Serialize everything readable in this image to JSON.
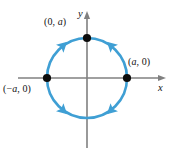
{
  "figure": {
    "type": "math-diagram",
    "background_color": "#ffffff",
    "curve": {
      "name": "circle",
      "color": "#3f9fd4",
      "stroke_width": 2.6,
      "center": [
        87,
        78
      ],
      "radius": 40,
      "orientation_arrow_count": 4
    },
    "axes": {
      "color": "#808080",
      "x_label": "x",
      "y_label": "y",
      "x_range_px": [
        18,
        166
      ],
      "y_range_px": [
        12,
        148
      ],
      "origin_px": [
        87,
        78
      ],
      "arrowheads": [
        "x-positive",
        "y-positive"
      ]
    },
    "points": [
      {
        "id": "top",
        "label": "(0, a)",
        "label_parts": {
          "pre": "(0, ",
          "italic": "a",
          "post": ")"
        },
        "color": "#0d0d0d",
        "position_px": [
          87,
          38
        ]
      },
      {
        "id": "right",
        "label": "(a, 0)",
        "label_parts": {
          "pre": "(",
          "italic": "a",
          "post": ", 0)"
        },
        "color": "#0d0d0d",
        "position_px": [
          127,
          78
        ]
      },
      {
        "id": "left",
        "label": "(−a, 0)",
        "label_parts": {
          "pre": "(−",
          "italic": "a",
          "post": ", 0)"
        },
        "color": "#0d0d0d",
        "position_px": [
          47,
          78
        ]
      }
    ]
  },
  "chart_data": {
    "type": "scatter",
    "title": "",
    "subtitle": "",
    "xlabel": "x",
    "ylabel": "y",
    "xlim": [
      -1.75,
      2.0
    ],
    "ylim": [
      -1.8,
      1.68
    ],
    "grid": false,
    "legend": null,
    "curves": [
      {
        "name": "circle",
        "equation": "x^2 + y^2 = a^2",
        "color": "#3f9fd4",
        "radius": 1,
        "center": [
          0,
          0
        ],
        "closed": true,
        "direction_markers": 4
      }
    ],
    "points": [
      {
        "label": "(0, a)",
        "x": 0,
        "y": 1,
        "marker": "filled-circle",
        "color": "#0d0d0d"
      },
      {
        "label": "(a, 0)",
        "x": 1,
        "y": 0,
        "marker": "filled-circle",
        "color": "#0d0d0d"
      },
      {
        "label": "(−a, 0)",
        "x": -1,
        "y": 0,
        "marker": "filled-circle",
        "color": "#0d0d0d"
      }
    ],
    "annotations": [
      {
        "text": "(0, a)",
        "x": 0,
        "y": 1,
        "placement": "upper-left"
      },
      {
        "text": "(a, 0)",
        "x": 1,
        "y": 0,
        "placement": "upper-right"
      },
      {
        "text": "(−a, 0)",
        "x": -1,
        "y": 0,
        "placement": "lower-left"
      }
    ]
  }
}
